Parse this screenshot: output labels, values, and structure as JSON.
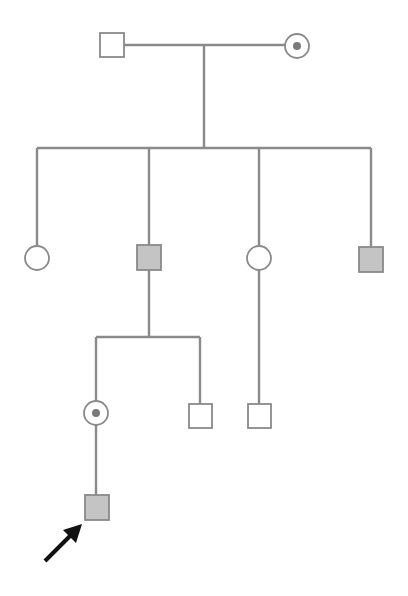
{
  "diagram": {
    "type": "pedigree",
    "colors": {
      "line": "#8a8a8a",
      "affected_fill": "#c4c4c4",
      "unaffected_fill": "#ffffff",
      "carrier_dot": "#7a7a7a",
      "proband_arrow": "#111111"
    },
    "generations": [
      {
        "id": "I",
        "members": [
          {
            "id": "I-1",
            "sex": "male",
            "status": "unaffected"
          },
          {
            "id": "I-2",
            "sex": "female",
            "status": "carrier"
          }
        ]
      },
      {
        "id": "II",
        "members": [
          {
            "id": "II-1",
            "sex": "female",
            "status": "unaffected"
          },
          {
            "id": "II-2",
            "sex": "male",
            "status": "affected"
          },
          {
            "id": "II-3",
            "sex": "female",
            "status": "unaffected"
          },
          {
            "id": "II-4",
            "sex": "male",
            "status": "affected"
          }
        ]
      },
      {
        "id": "III",
        "members": [
          {
            "id": "III-1",
            "sex": "female",
            "status": "carrier",
            "parent": "II-2"
          },
          {
            "id": "III-2",
            "sex": "male",
            "status": "unaffected",
            "parent": "II-2"
          },
          {
            "id": "III-3",
            "sex": "male",
            "status": "unaffected",
            "parent": "II-3"
          }
        ]
      },
      {
        "id": "IV",
        "members": [
          {
            "id": "IV-1",
            "sex": "male",
            "status": "affected",
            "parent": "III-1",
            "proband": true
          }
        ]
      }
    ]
  }
}
